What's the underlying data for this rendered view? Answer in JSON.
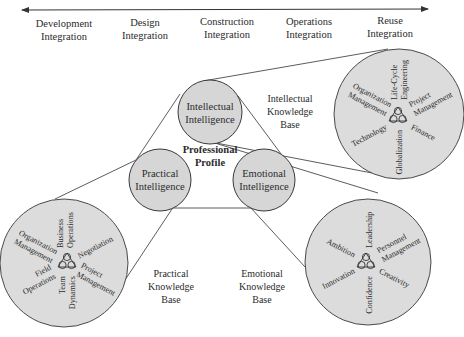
{
  "timeline": {
    "phases": [
      {
        "line1": "Development",
        "line2": "Integration"
      },
      {
        "line1": "Design",
        "line2": "Integration"
      },
      {
        "line1": "Construction",
        "line2": "Integration"
      },
      {
        "line1": "Operations",
        "line2": "Integration"
      },
      {
        "line1": "Reuse",
        "line2": "Integration"
      }
    ]
  },
  "center": {
    "line1": "Professional",
    "line2": "Profile"
  },
  "intelligences": {
    "intellectual": {
      "line1": "Intellectual",
      "line2": "Intelligence"
    },
    "practical": {
      "line1": "Practical",
      "line2": "Intelligence"
    },
    "emotional": {
      "line1": "Emotional",
      "line2": "Intelligence"
    }
  },
  "knowledge_bases": {
    "intellectual": {
      "line1": "Intellectual",
      "line2": "Knowledge",
      "line3": "Base"
    },
    "practical": {
      "line1": "Practical",
      "line2": "Knowledge",
      "line3": "Base"
    },
    "emotional": {
      "line1": "Emotional",
      "line2": "Knowledge",
      "line3": "Base"
    }
  },
  "intellectual_base": {
    "items": [
      {
        "line1": "Life-Cycle",
        "line2": "Engineering"
      },
      {
        "line1": "Project",
        "line2": "Management"
      },
      {
        "line1": "Finance",
        "line2": ""
      },
      {
        "line1": "Globalization",
        "line2": ""
      },
      {
        "line1": "Technology",
        "line2": ""
      },
      {
        "line1": "Organization",
        "line2": "Management"
      }
    ]
  },
  "practical_base": {
    "items": [
      {
        "line1": "Business",
        "line2": "Operations"
      },
      {
        "line1": "Negotiation",
        "line2": ""
      },
      {
        "line1": "Project",
        "line2": "Management"
      },
      {
        "line1": "Team",
        "line2": "Dynamics"
      },
      {
        "line1": "Field",
        "line2": "Operations"
      },
      {
        "line1": "Organization",
        "line2": "Management"
      }
    ]
  },
  "emotional_base": {
    "items": [
      {
        "line1": "Leadership",
        "line2": ""
      },
      {
        "line1": "Personnel",
        "line2": "Management"
      },
      {
        "line1": "Creativity",
        "line2": ""
      },
      {
        "line1": "Confidence",
        "line2": ""
      },
      {
        "line1": "Innovation",
        "line2": ""
      },
      {
        "line1": "Ambition",
        "line2": ""
      }
    ]
  },
  "icons": {
    "trefoil": "trefoil-icon",
    "timeline_arrow": "double-arrow-icon"
  },
  "colors": {
    "circle_fill": "#dcdcdc",
    "stroke": "#4a4a4a",
    "text": "#2b2b2b"
  }
}
